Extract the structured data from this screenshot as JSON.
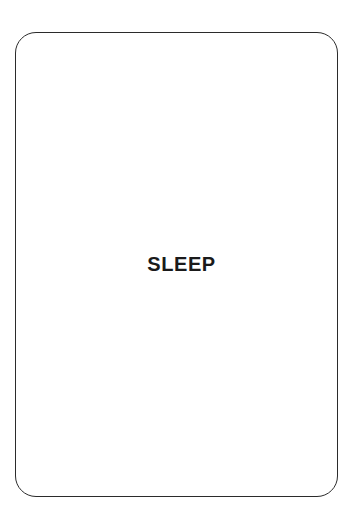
{
  "page": {
    "background_color": "#ffffff",
    "width": 363,
    "height": 526
  },
  "diagram": {
    "type": "state-box",
    "nodes": [
      {
        "id": "sleep",
        "label": "SLEEP",
        "shape": "rounded-rectangle",
        "fill_color": "#ffffff",
        "border_color": "#2b2b2b",
        "text_color": "#1a1a1a",
        "corner_radius": 21,
        "border_width": 1.8,
        "bounds": {
          "x": 15,
          "y": 32,
          "width": 323,
          "height": 465
        }
      }
    ]
  }
}
